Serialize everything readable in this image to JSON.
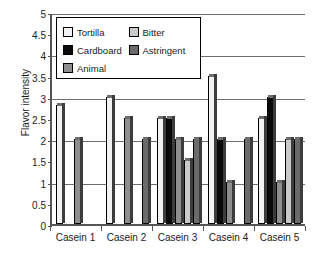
{
  "chart_data": {
    "type": "bar",
    "title": "",
    "xlabel": "",
    "ylabel": "Flavor intensity",
    "categories": [
      "Casein 1",
      "Casein 2",
      "Casein 3",
      "Casein 4",
      "Casein 5"
    ],
    "series": [
      {
        "name": "Tortilla",
        "color": "#f2f2f2",
        "values": [
          2.8,
          3.0,
          2.5,
          3.5,
          2.5
        ]
      },
      {
        "name": "Cardboard",
        "color": "#0a0a0a",
        "values": [
          0,
          0,
          2.5,
          2.0,
          3.0
        ]
      },
      {
        "name": "Animal",
        "color": "#8e8e8e",
        "values": [
          2.0,
          2.5,
          2.0,
          1.0,
          1.0
        ]
      },
      {
        "name": "Bitter",
        "color": "#c9c9c9",
        "values": [
          0,
          0,
          1.5,
          0,
          2.0
        ]
      },
      {
        "name": "Astringent",
        "color": "#6b6b6b",
        "values": [
          0,
          2.0,
          2.0,
          2.0,
          2.0
        ]
      }
    ],
    "ylim": [
      0,
      5
    ],
    "yticks": [
      "5",
      "4.5",
      "4",
      "3.5",
      "3",
      "2.5",
      "2",
      "1.5",
      "1",
      "0.5",
      "0"
    ],
    "ytick_values": [
      5,
      4.5,
      4,
      3.5,
      3,
      2.5,
      2,
      1.5,
      1,
      0.5,
      0
    ],
    "grid": true,
    "grid_major_only": true,
    "grid_values": [
      5,
      4,
      3,
      2,
      1
    ],
    "legend_position": "upper-left-inside",
    "legend_columns": 2
  }
}
